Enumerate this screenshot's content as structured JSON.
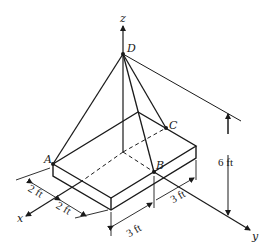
{
  "figure": {
    "points": {
      "D": "D",
      "A": "A",
      "B": "B",
      "C": "C"
    },
    "axes": {
      "x": "x",
      "y": "y",
      "z": "z"
    },
    "dimensions": {
      "height": "6 ft",
      "x_dim_1": "2 ft",
      "x_dim_2": "2 ft",
      "y_dim_1": "3 ft",
      "y_dim_2": "3 ft"
    },
    "colors": {
      "line": "#1a1a1a",
      "background": "#ffffff"
    }
  }
}
